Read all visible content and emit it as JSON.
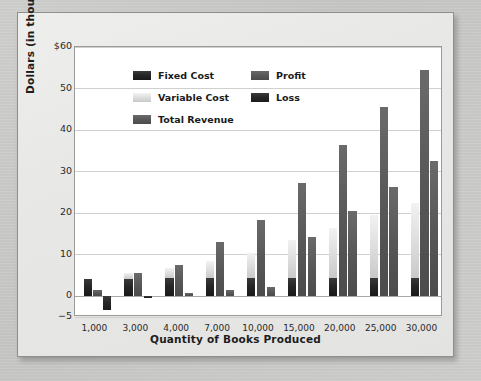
{
  "chart_data": {
    "type": "bar",
    "title": "",
    "subtitle": "",
    "xlabel": "Quantity of Books Produced",
    "ylabel": "Dollars (in thousands)",
    "categories": [
      "1,000",
      "3,000",
      "4,000",
      "7,000",
      "10,000",
      "15,000",
      "20,000",
      "25,000",
      "30,000"
    ],
    "ylim": [
      -5,
      60
    ],
    "yticks": [
      "$60",
      "50",
      "40",
      "30",
      "20",
      "10",
      "0",
      "-5"
    ],
    "ytick_values": [
      60,
      50,
      40,
      30,
      20,
      10,
      0,
      -5
    ],
    "grid": "horizontal",
    "legend_position": "inside-top-left",
    "stacked_cost_note": "Fixed Cost and Variable Cost are drawn as one stacked column per category",
    "series": [
      {
        "name": "Fixed Cost",
        "color": "#262626",
        "values": [
          4.2,
          4.2,
          4.3,
          4.3,
          4.4,
          4.5,
          4.5,
          4.5,
          4.5
        ]
      },
      {
        "name": "Variable Cost",
        "color": "#dcdcdc",
        "values": [
          0,
          1.4,
          2.4,
          4.2,
          6.1,
          9.0,
          12.0,
          15.0,
          18.0
        ]
      },
      {
        "name": "Total Revenue",
        "color": "#585858",
        "values": [
          1.6,
          5.5,
          7.4,
          13.0,
          18.3,
          27.2,
          36.4,
          45.5,
          54.5
        ]
      },
      {
        "name": "Profit",
        "color": "#585858",
        "values": [
          0,
          0,
          0.8,
          1.5,
          2.3,
          14.3,
          20.4,
          26.4,
          32.5
        ]
      },
      {
        "name": "Loss",
        "color": "#262626",
        "values": [
          -3.4,
          -0.5,
          0,
          0,
          0,
          0,
          0,
          0,
          0
        ]
      }
    ],
    "legend": [
      {
        "label": "Fixed Cost",
        "color": "#262626"
      },
      {
        "label": "Variable Cost",
        "color": "#dcdcdc"
      },
      {
        "label": "Total Revenue",
        "color": "#585858"
      },
      {
        "label": "Profit",
        "color": "#585858"
      },
      {
        "label": "Loss",
        "color": "#262626"
      }
    ]
  },
  "colors": {
    "page_background": "#c9c9c7",
    "card_background": "#eaeae8",
    "plot_background": "#ffffff",
    "gridline": "#d0d0ce",
    "axis_text": "#2a2a2a",
    "label_text": "#1d1d1d"
  }
}
